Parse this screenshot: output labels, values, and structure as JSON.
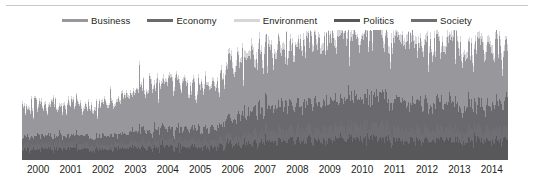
{
  "chart_data": {
    "type": "area",
    "stacked": true,
    "title": "",
    "subtitle": "",
    "xlabel": "",
    "ylabel": "",
    "grid": false,
    "legend_position": "top-center",
    "x": [
      2000,
      2001,
      2002,
      2003,
      2004,
      2005,
      2006,
      2007,
      2008,
      2009,
      2010,
      2011,
      2012,
      2013,
      2014
    ],
    "xlim": [
      2000,
      2015
    ],
    "ylim": [
      0,
      100
    ],
    "xtick_labels": [
      "2000",
      "2001",
      "2002",
      "2003",
      "2004",
      "2005",
      "2006",
      "2007",
      "2008",
      "2009",
      "2010",
      "2011",
      "2012",
      "2013",
      "2014"
    ],
    "ytick_labels": [],
    "series": [
      {
        "name": "Politics",
        "color": "#58575a",
        "stack_order": 0,
        "values": [
          9,
          9,
          8,
          9,
          10,
          10,
          10,
          14,
          15,
          15,
          16,
          17,
          15,
          15,
          15
        ]
      },
      {
        "name": "Society",
        "color": "#6f6e72",
        "stack_order": 1,
        "values": [
          4,
          4,
          4,
          4,
          5,
          5,
          5,
          8,
          9,
          9,
          10,
          10,
          9,
          9,
          9
        ]
      },
      {
        "name": "Economy",
        "color": "#6a696d",
        "stack_order": 2,
        "values": [
          6,
          6,
          6,
          7,
          9,
          9,
          9,
          18,
          20,
          20,
          21,
          23,
          20,
          20,
          19
        ]
      },
      {
        "name": "Business",
        "color": "#98979b",
        "stack_order": 3,
        "values": [
          24,
          23,
          22,
          26,
          33,
          33,
          33,
          42,
          45,
          45,
          47,
          50,
          45,
          44,
          43
        ]
      },
      {
        "name": "Environment",
        "color": "#d6d5d8",
        "stack_order": 4,
        "values": [
          2,
          2,
          2,
          2,
          3,
          3,
          3,
          5,
          5,
          5,
          6,
          6,
          5,
          5,
          5
        ]
      }
    ]
  },
  "legend": {
    "items": [
      {
        "label": "Business",
        "color": "#98979b"
      },
      {
        "label": "Economy",
        "color": "#6a696d"
      },
      {
        "label": "Environment",
        "color": "#d6d5d8"
      },
      {
        "label": "Politics",
        "color": "#58575a"
      },
      {
        "label": "Society",
        "color": "#6f6e72"
      }
    ]
  },
  "axis": {
    "ticks": [
      "2000",
      "2001",
      "2002",
      "2003",
      "2004",
      "2005",
      "2006",
      "2007",
      "2008",
      "2009",
      "2010",
      "2011",
      "2012",
      "2013",
      "2014"
    ]
  }
}
